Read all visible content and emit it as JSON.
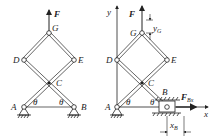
{
  "left_figure": {
    "force_label": "F",
    "points": {
      "G": "G",
      "D": "D",
      "E": "E",
      "C": "C",
      "A": "A",
      "B": "B"
    },
    "angle_left": "θ",
    "angle_right": "θ"
  },
  "right_figure": {
    "axis_y": "y",
    "axis_x": "x",
    "force_label": "F",
    "points": {
      "G": "G",
      "D": "D",
      "E": "E",
      "C": "C",
      "A": "A",
      "B": "B"
    },
    "angle_left": "θ",
    "angle_right": "θ",
    "dim_y": {
      "main": "y",
      "sub": "G"
    },
    "dim_x": {
      "main": "x",
      "sub": "B"
    },
    "reaction_force": {
      "main": "F",
      "sub": "Bx"
    }
  },
  "colors": {
    "line": "#222222",
    "background": "#ffffff"
  }
}
